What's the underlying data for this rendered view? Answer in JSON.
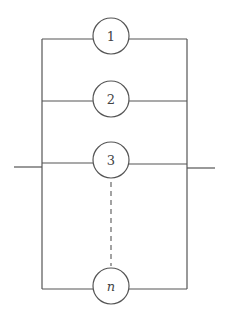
{
  "diagram": {
    "type": "parallel-system",
    "colors": {
      "line": "#555555",
      "background": "#ffffff",
      "text": "#444444"
    },
    "components": [
      {
        "id": "c1",
        "label": "1",
        "italic": false
      },
      {
        "id": "c2",
        "label": "2",
        "italic": false
      },
      {
        "id": "c3",
        "label": "3",
        "italic": false
      },
      {
        "id": "cn",
        "label": "n",
        "italic": true
      }
    ],
    "ellipsis": "dashed connector between component 3 and component n"
  }
}
